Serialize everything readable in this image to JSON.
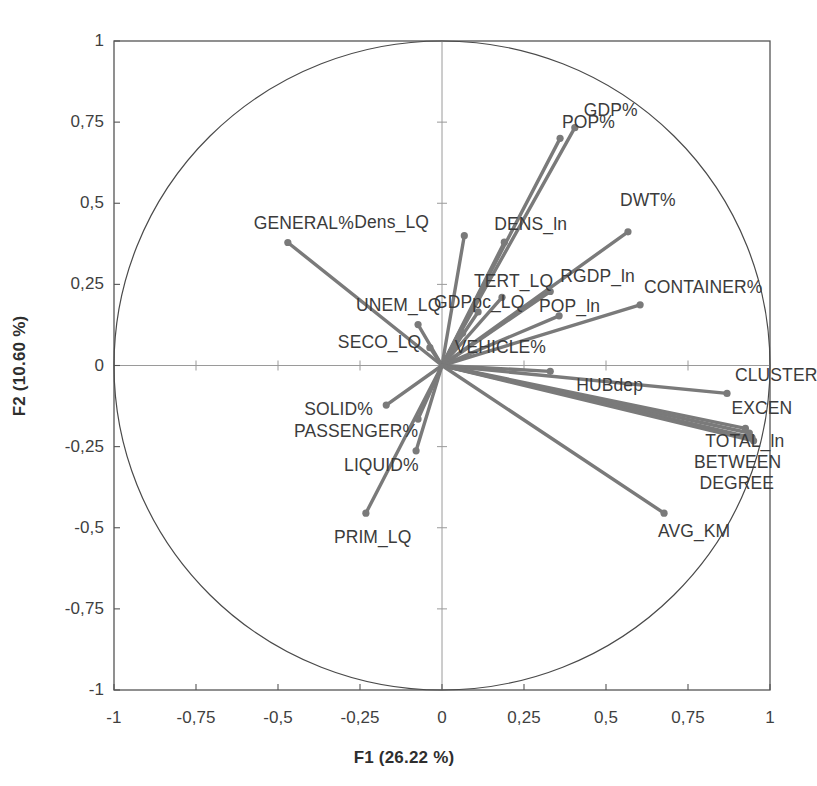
{
  "chart_data": {
    "type": "scatter",
    "subtype": "pca-correlation-circle",
    "title": "",
    "xlabel": "F1 (26.22 %)",
    "ylabel": "F2 (10.60 %)",
    "xlim": [
      -1,
      1
    ],
    "ylim": [
      -1,
      1
    ],
    "grid": false,
    "legend": "none",
    "decimal_separator": ",",
    "unit_circle": true,
    "axis_lines": {
      "x_at": 0,
      "y_at": 0,
      "style": "thin-gray"
    },
    "xticks": [
      "-1",
      "-0,75",
      "-0,5",
      "-0,25",
      "0",
      "0,25",
      "0,5",
      "0,75",
      "1"
    ],
    "xtick_values": [
      -1,
      -0.75,
      -0.5,
      -0.25,
      0,
      0.25,
      0.5,
      0.75,
      1
    ],
    "yticks": [
      "1",
      "0,75",
      "0,5",
      "0,25",
      "0",
      "-0,25",
      "-0,5",
      "-0,75",
      "-1"
    ],
    "ytick_values": [
      1,
      0.75,
      0.5,
      0.25,
      0,
      -0.25,
      -0.5,
      -0.75,
      -1
    ],
    "variables": [
      {
        "name": "GDP%",
        "x": 0.405,
        "y": 0.733,
        "label_dx": 9,
        "label_dy": -26,
        "label_anchor": "start"
      },
      {
        "name": "POP%",
        "x": 0.36,
        "y": 0.7,
        "label_dx": 2,
        "label_dy": -24,
        "label_anchor": "start"
      },
      {
        "name": "DENS_ln",
        "x": 0.19,
        "y": 0.38,
        "label_dx": -10,
        "label_dy": -26,
        "label_anchor": "start"
      },
      {
        "name": "Dens_LQ",
        "x": 0.068,
        "y": 0.4,
        "label_dx": -110,
        "label_dy": -22,
        "label_anchor": "start"
      },
      {
        "name": "DWT%",
        "x": 0.567,
        "y": 0.412,
        "label_dx": -8,
        "label_dy": -40,
        "label_anchor": "start"
      },
      {
        "name": "CONTAINER%",
        "x": 0.604,
        "y": 0.187,
        "label_dx": 4,
        "label_dy": -26,
        "label_anchor": "start"
      },
      {
        "name": "RGDP_ln",
        "x": 0.33,
        "y": 0.228,
        "label_dx": 10,
        "label_dy": -24,
        "label_anchor": "start"
      },
      {
        "name": "TERT_LQ",
        "x": 0.183,
        "y": 0.21,
        "label_dx": -28,
        "label_dy": -24,
        "label_anchor": "start"
      },
      {
        "name": "GDPpc_LQ",
        "x": 0.11,
        "y": 0.165,
        "label_dx": -44,
        "label_dy": -18,
        "label_anchor": "start"
      },
      {
        "name": "POP_ln",
        "x": 0.357,
        "y": 0.153,
        "label_dx": -20,
        "label_dy": -18,
        "label_anchor": "start"
      },
      {
        "name": "VEHICLE%",
        "x": 0.063,
        "y": 0.1,
        "label_dx": -8,
        "label_dy": 6,
        "label_anchor": "start"
      },
      {
        "name": "UNEM_LQ",
        "x": -0.073,
        "y": 0.126,
        "label_dx": -62,
        "label_dy": -28,
        "label_anchor": "start"
      },
      {
        "name": "SECO_LQ",
        "x": -0.037,
        "y": 0.055,
        "label_dx": -92,
        "label_dy": -14,
        "label_anchor": "start"
      },
      {
        "name": "GENERAL%",
        "x": -0.47,
        "y": 0.379,
        "label_dx": -34,
        "label_dy": -28,
        "label_anchor": "start"
      },
      {
        "name": "CLUSTER",
        "x": 0.869,
        "y": -0.086,
        "label_dx": 8,
        "label_dy": -26,
        "label_anchor": "start"
      },
      {
        "name": "HUBdep",
        "x": 0.33,
        "y": -0.018,
        "label_dx": 26,
        "label_dy": 6,
        "label_anchor": "start"
      },
      {
        "name": "EXCEN",
        "x": 0.925,
        "y": -0.194,
        "label_dx": -14,
        "label_dy": -28,
        "label_anchor": "start"
      },
      {
        "name": "TOTAL_ln",
        "x": 0.937,
        "y": -0.208,
        "label_dx": -44,
        "label_dy": 0,
        "label_anchor": "start"
      },
      {
        "name": "BETWEEN",
        "x": 0.945,
        "y": -0.222,
        "label_dx": -58,
        "label_dy": 16,
        "label_anchor": "start"
      },
      {
        "name": "DEGREE",
        "x": 0.95,
        "y": -0.232,
        "label_dx": -54,
        "label_dy": 34,
        "label_anchor": "start"
      },
      {
        "name": "AVG_KM",
        "x": 0.677,
        "y": -0.455,
        "label_dx": -6,
        "label_dy": 10,
        "label_anchor": "start"
      },
      {
        "name": "SOLID%",
        "x": -0.17,
        "y": -0.122,
        "label_dx": -82,
        "label_dy": -4,
        "label_anchor": "start"
      },
      {
        "name": "PASSENGER%",
        "x": -0.073,
        "y": -0.165,
        "label_dx": -124,
        "label_dy": 4,
        "label_anchor": "start"
      },
      {
        "name": "LIQUID%",
        "x": -0.079,
        "y": -0.263,
        "label_dx": -72,
        "label_dy": 6,
        "label_anchor": "start"
      },
      {
        "name": "PRIM_LQ",
        "x": -0.232,
        "y": -0.455,
        "label_dx": -32,
        "label_dy": 16,
        "label_anchor": "start"
      }
    ]
  },
  "style": {
    "vector_color": "#7a7a7a",
    "circle_color": "#4a4a4a",
    "frame_color": "#555555",
    "axis_color": "#9a9a9a",
    "text_color": "#3b3b3b",
    "background": "#ffffff"
  }
}
